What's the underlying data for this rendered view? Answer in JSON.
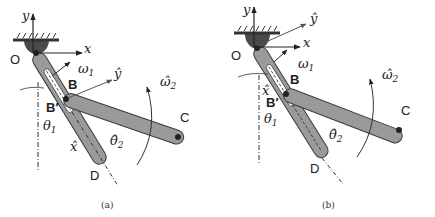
{
  "figure": {
    "panels": [
      {
        "id": "a",
        "caption": "(a)",
        "labels": {
          "y_axis": "y",
          "x_axis": "x",
          "origin": "O",
          "omega1": "ω",
          "omega1_sub": "1",
          "point_b": "B",
          "y_hat": "ŷ",
          "omega2_hat": "ω̂",
          "omega2_sub": "2",
          "point_c": "C",
          "point_b_prime": "B′",
          "theta1": "θ",
          "theta1_sub": "1",
          "theta2_hat": "θ̂",
          "theta2_sub": "2",
          "x_hat": "x̂",
          "point_d": "D"
        }
      },
      {
        "id": "b",
        "caption": "(b)",
        "labels": {
          "y_axis": "y",
          "x_axis": "x",
          "origin": "O",
          "omega1": "ω",
          "omega1_sub": "1",
          "point_b": "B",
          "y_hat": "ŷ",
          "omega2_hat": "ω̂",
          "omega2_sub": "2",
          "point_c": "C",
          "point_b_prime": "B′",
          "theta1": "θ",
          "theta1_sub": "1",
          "theta2_hat": "θ̂",
          "theta2_sub": "2",
          "x_hat": "x̂",
          "point_d": "D"
        }
      }
    ],
    "colors": {
      "link_fill": "#9a9a9a",
      "link_stroke": "#3a3a3a",
      "housing_fill": "#4a4a4a",
      "slot_fill": "#ffffff",
      "line": "#222222",
      "arrow": "#555555"
    }
  }
}
